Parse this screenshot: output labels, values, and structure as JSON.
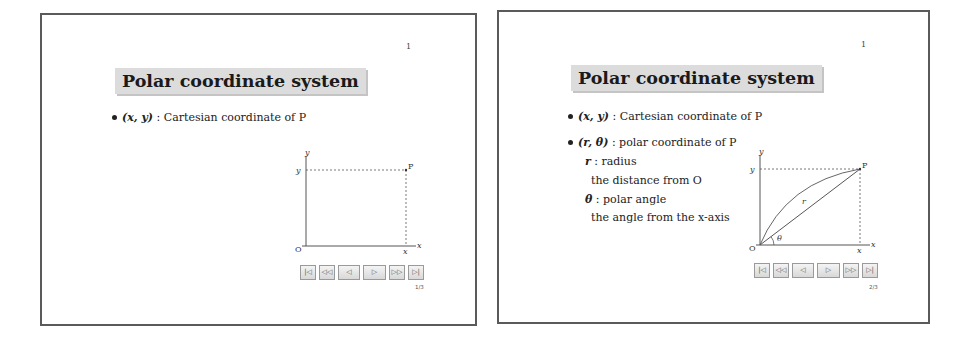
{
  "slides": [
    {
      "page_number": "1",
      "title": "Polar coordinate system",
      "bullets": [
        {
          "math": "(x,  y)",
          "text": " : Cartesian coordinate of P"
        }
      ],
      "diagram": {
        "axis_x_label": "x",
        "axis_y_label": "y",
        "origin_label": "O",
        "point_label": "P",
        "x_tick_label": "x",
        "y_tick_label": "y"
      },
      "nav_buttons": [
        "|◁",
        "◁◁",
        "◁",
        "▷",
        "▷▷",
        "▷|"
      ],
      "counter": "1/3"
    },
    {
      "page_number": "1",
      "title": "Polar coordinate system",
      "bullets": [
        {
          "math": "(x,  y)",
          "text": " : Cartesian coordinate of P"
        },
        {
          "math": "(r,  θ)",
          "text": " : polar coordinate of P"
        }
      ],
      "sub_items": [
        {
          "math": "r",
          "text": " : radius"
        },
        {
          "math": "",
          "text": "the distance from O"
        },
        {
          "math": "θ",
          "text": " : polar angle"
        },
        {
          "math": "",
          "text": "the angle from the x-axis"
        }
      ],
      "diagram": {
        "axis_x_label": "x",
        "axis_y_label": "y",
        "origin_label": "O",
        "point_label": "P",
        "x_tick_label": "x",
        "y_tick_label": "y",
        "radius_label": "r",
        "angle_label": "θ"
      },
      "nav_buttons": [
        "|◁",
        "◁◁",
        "◁",
        "▷",
        "▷▷",
        "▷|"
      ],
      "counter": "2/3"
    }
  ]
}
